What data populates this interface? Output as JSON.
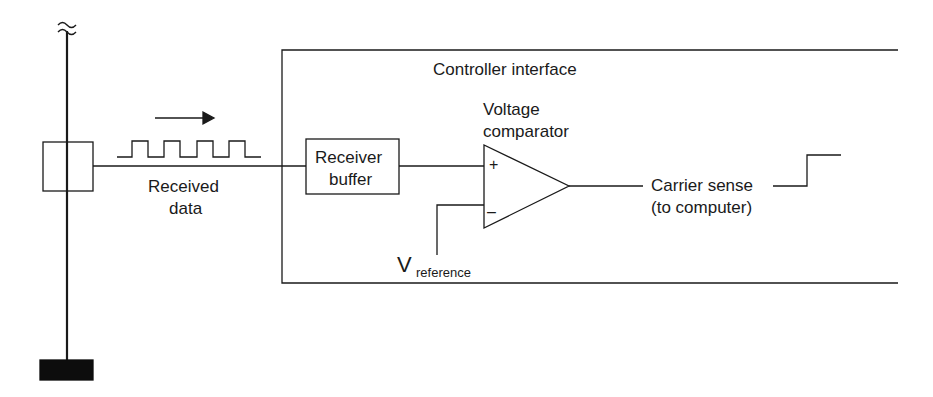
{
  "diagram": {
    "type": "circuit-block-diagram",
    "colors": {
      "line": "#1a1a1a",
      "background": "#ffffff",
      "terminator": "#0d0d0d"
    },
    "bus": {
      "break_symbol": "≈",
      "tap_box": {
        "label": ""
      },
      "terminator": {
        "label": ""
      }
    },
    "signal_in": {
      "label_line1": "Received",
      "label_line2": "data",
      "waveform": "square-wave",
      "direction": "right-arrow"
    },
    "controller": {
      "title": "Controller interface",
      "receiver_buffer": {
        "label_line1": "Receiver",
        "label_line2": "buffer"
      },
      "comparator": {
        "label_line1": "Voltage",
        "label_line2": "comparator",
        "plus_sign": "+",
        "minus_sign": "–"
      },
      "reference": {
        "main": "V",
        "subscript": "reference"
      }
    },
    "output": {
      "label_line1": "Carrier sense",
      "label_line2": "(to computer)",
      "waveform": "step-up"
    }
  }
}
